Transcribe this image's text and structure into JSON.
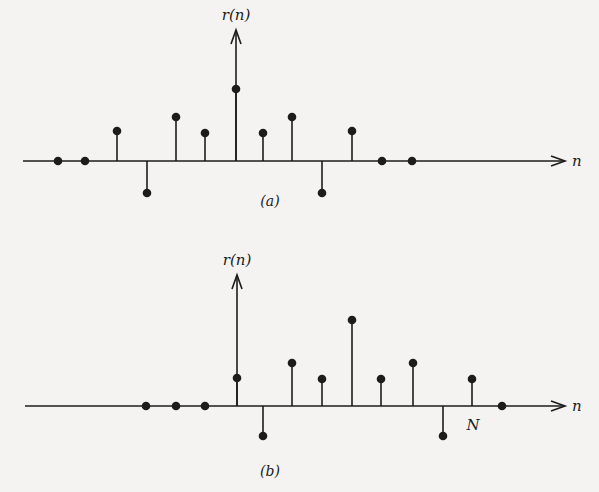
{
  "figure": {
    "background": "#f4f3f1",
    "ink": "#1c1c1c",
    "panels": [
      {
        "id": "a",
        "caption": "(a)",
        "y_label": "r(n)",
        "x_label": "n",
        "axis_y": 161,
        "axis_x_start": 23,
        "axis_x_end": 565,
        "origin_x": 236,
        "arrow_top": 30,
        "ylabel_pos": [
          236,
          20
        ],
        "xlabel_pos": [
          572,
          166
        ],
        "caption_pos": [
          270,
          206
        ],
        "stems": [
          {
            "x": 58,
            "y": 161
          },
          {
            "x": 85,
            "y": 161
          },
          {
            "x": 117,
            "y": 131
          },
          {
            "x": 147,
            "y": 193
          },
          {
            "x": 176,
            "y": 117
          },
          {
            "x": 205,
            "y": 133
          },
          {
            "x": 236,
            "y": 89
          },
          {
            "x": 263,
            "y": 133
          },
          {
            "x": 292,
            "y": 117
          },
          {
            "x": 322,
            "y": 193
          },
          {
            "x": 352,
            "y": 131
          },
          {
            "x": 382,
            "y": 161
          },
          {
            "x": 412,
            "y": 161
          }
        ]
      },
      {
        "id": "b",
        "caption": "(b)",
        "y_label": "r(n)",
        "x_label": "n",
        "axis_y": 406,
        "axis_x_start": 25,
        "axis_x_end": 565,
        "origin_x": 237,
        "arrow_top": 275,
        "ylabel_pos": [
          237,
          265
        ],
        "xlabel_pos": [
          572,
          411
        ],
        "caption_pos": [
          270,
          476
        ],
        "n_marker": {
          "label": "N",
          "pos": [
            473,
            430
          ]
        },
        "stems": [
          {
            "x": 146,
            "y": 406
          },
          {
            "x": 176,
            "y": 406
          },
          {
            "x": 205,
            "y": 406
          },
          {
            "x": 237,
            "y": 378
          },
          {
            "x": 263,
            "y": 436
          },
          {
            "x": 292,
            "y": 363
          },
          {
            "x": 322,
            "y": 379
          },
          {
            "x": 352,
            "y": 320
          },
          {
            "x": 381,
            "y": 379
          },
          {
            "x": 413,
            "y": 363
          },
          {
            "x": 443,
            "y": 436
          },
          {
            "x": 472,
            "y": 379
          },
          {
            "x": 502,
            "y": 406
          }
        ]
      }
    ]
  }
}
